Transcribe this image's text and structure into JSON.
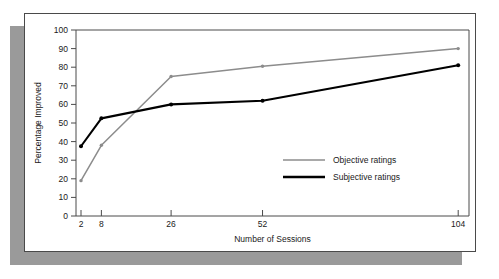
{
  "chart_data": {
    "type": "line",
    "title": "",
    "xlabel": "Number of Sessions",
    "ylabel": "Percentage Improved",
    "categories": [
      "2",
      "8",
      "26",
      "52",
      "104"
    ],
    "x": [
      2,
      8,
      26,
      52,
      104
    ],
    "xticklabels": [
      "2",
      "8",
      "26",
      "52",
      "104"
    ],
    "yticklabels": [
      "0",
      "10",
      "20",
      "30",
      "40",
      "50",
      "60",
      "70",
      "80",
      "90",
      "100"
    ],
    "yticks": [
      0,
      10,
      20,
      30,
      40,
      50,
      60,
      70,
      80,
      90,
      100
    ],
    "ylim": [
      0,
      100
    ],
    "xscale": "log-like ordinal spacing",
    "grid": false,
    "legend_position": "center-right inside plot",
    "series": [
      {
        "name": "Objective ratings",
        "color": "#8c8c8c",
        "values": [
          19,
          38,
          75,
          80.5,
          90
        ]
      },
      {
        "name": "Subjective ratings",
        "color": "#000000",
        "values": [
          37.5,
          52.5,
          60,
          62,
          81
        ]
      }
    ]
  },
  "legend": {
    "items": [
      {
        "label": "Objective ratings",
        "color": "#8c8c8c"
      },
      {
        "label": "Subjective ratings",
        "color": "#000000"
      }
    ]
  }
}
